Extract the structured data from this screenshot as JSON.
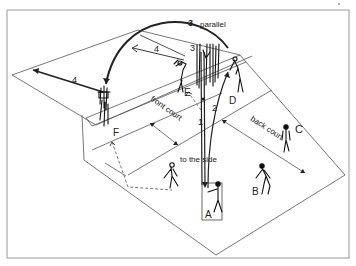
{
  "diagram": {
    "labels": {
      "parallel": "parallel",
      "front_court": "front court",
      "back_court": "back court",
      "to_the_side": "to the side"
    },
    "players": {
      "A": "A",
      "B": "B",
      "C": "C",
      "D": "D",
      "E": "E",
      "F": "F"
    },
    "pass_numbers": {
      "n1": "1",
      "n2": "2",
      "n3_arc": "3",
      "n3_net": "3",
      "n4_left": "4",
      "n4_top": "4"
    },
    "corner_mark": "*",
    "colors": {
      "line": "#555555",
      "ink": "#222222",
      "frame": "#999999",
      "background": "#ffffff"
    }
  }
}
